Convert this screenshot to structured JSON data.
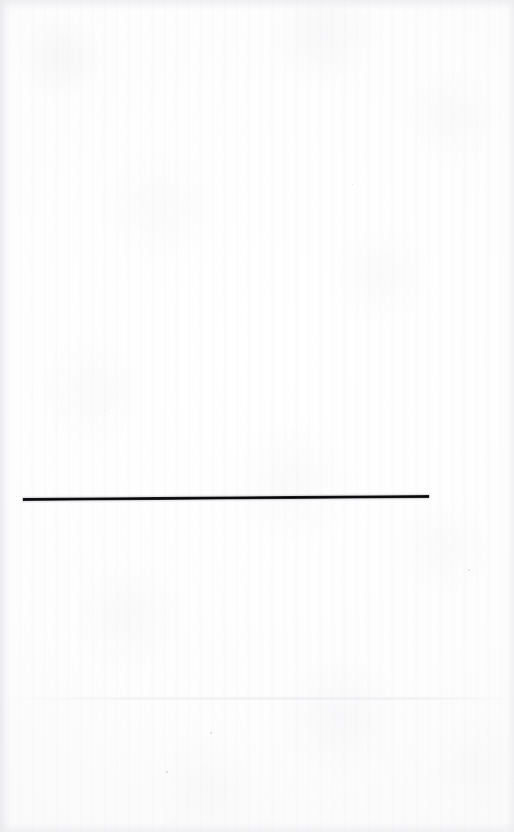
{
  "page": {
    "kind": "scanned-blank-page",
    "width_px": 514,
    "height_px": 832,
    "background_color": "#fefefe",
    "paper_tone_color": "#fafafa",
    "edge_shadow_color": "#e8e8ec",
    "text_content": "",
    "visible_labels": []
  },
  "rule": {
    "name": "horizontal-rule",
    "color": "#08080a",
    "edge_color": "#6e6e73",
    "x_start_px": 23,
    "x_end_px": 429,
    "length_px": 406,
    "y_left_px": 499,
    "y_right_px": 496,
    "thickness_px": 3,
    "tilt_degrees": -0.42
  },
  "artifacts": {
    "crease": {
      "name": "paper-crease",
      "y_px": 697,
      "color": "#ecedf0"
    },
    "specks": [
      {
        "x_px": 210,
        "y_px": 732,
        "size_px": 2,
        "color": "#d4d4d8"
      },
      {
        "x_px": 166,
        "y_px": 771,
        "size_px": 2,
        "color": "#d8d8dc"
      },
      {
        "x_px": 468,
        "y_px": 569,
        "size_px": 2,
        "color": "#dcdce0"
      },
      {
        "x_px": 352,
        "y_px": 184,
        "size_px": 1,
        "color": "#dedee2"
      },
      {
        "x_px": 104,
        "y_px": 410,
        "size_px": 1,
        "color": "#dededf"
      }
    ]
  }
}
